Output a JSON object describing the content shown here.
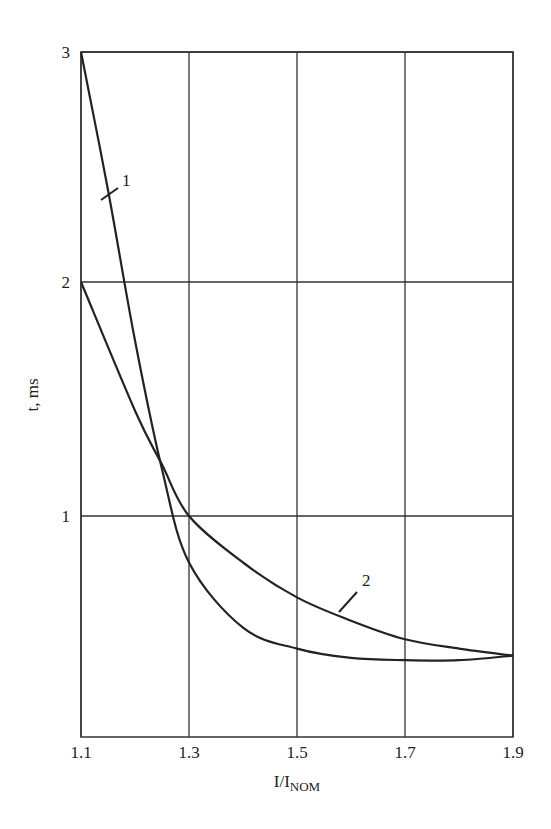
{
  "chart_data": {
    "type": "line",
    "title": "",
    "xlabel": "I/I_NOM",
    "xlabel_main": "I/I",
    "xlabel_sub": "NOM",
    "ylabel": "t, ms",
    "xlim": [
      1.1,
      1.9
    ],
    "ylim": [
      0.05,
      3.0
    ],
    "xticks": [
      "1.1",
      "1.3",
      "1.5",
      "1.7",
      "1.9"
    ],
    "yticks": [
      "1",
      "2",
      "3"
    ],
    "grid": true,
    "legend": "none (curves labeled inline with leader lines)",
    "series": [
      {
        "name": "1",
        "x": [
          1.1,
          1.15,
          1.2,
          1.25,
          1.3,
          1.4,
          1.5,
          1.6,
          1.7,
          1.8,
          1.9
        ],
        "y": [
          3.0,
          2.4,
          1.75,
          1.2,
          0.8,
          0.52,
          0.43,
          0.39,
          0.38,
          0.38,
          0.4
        ]
      },
      {
        "name": "2",
        "x": [
          1.1,
          1.2,
          1.25,
          1.3,
          1.4,
          1.5,
          1.6,
          1.7,
          1.8,
          1.9
        ],
        "y": [
          2.0,
          1.45,
          1.22,
          1.0,
          0.8,
          0.65,
          0.55,
          0.47,
          0.43,
          0.4
        ]
      }
    ]
  },
  "colors": {
    "line": "#222222",
    "grid": "#333333",
    "background": "#ffffff"
  }
}
